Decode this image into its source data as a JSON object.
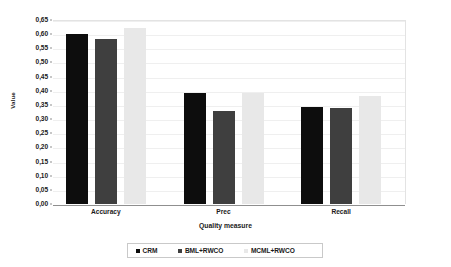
{
  "chart_data": {
    "type": "bar",
    "title": "",
    "xlabel": "Quality measure",
    "ylabel": "Value",
    "categories": [
      "Accuracy",
      "Prec",
      "Recall"
    ],
    "series": [
      {
        "name": "CRM",
        "color": "#0d0d0d",
        "values": [
          0.6,
          0.393,
          0.342
        ]
      },
      {
        "name": "BML+RWCO",
        "color": "#3f3f3f",
        "values": [
          0.584,
          0.328,
          0.34
        ]
      },
      {
        "name": "MCML+RWCO",
        "color": "#e8e8e8",
        "values": [
          0.622,
          0.391,
          0.38
        ]
      }
    ],
    "ylim": [
      0.0,
      0.65
    ],
    "ytick_step": 0.05,
    "ytick_labels": [
      "0,00",
      "0,05",
      "0,10",
      "0,15",
      "0,20",
      "0,25",
      "0,30",
      "0,35",
      "0,40",
      "0,45",
      "0,50",
      "0,55",
      "0,60",
      "0,65"
    ],
    "ytick_values": [
      0.0,
      0.05,
      0.1,
      0.15,
      0.2,
      0.25,
      0.3,
      0.35,
      0.4,
      0.45,
      0.5,
      0.55,
      0.6,
      0.65
    ],
    "grid": true,
    "legend_position": "bottom"
  },
  "axes": {
    "y_title": "Value",
    "x_title": "Quality measure"
  }
}
